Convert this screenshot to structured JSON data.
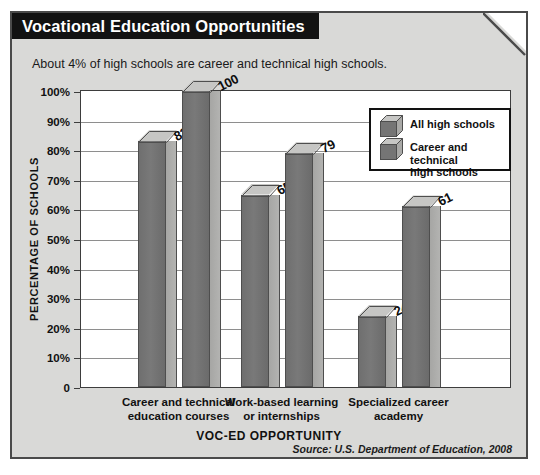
{
  "panel": {
    "title": "Vocational Education Opportunities",
    "subtitle": "About 4% of high schools are career and technical high schools.",
    "source": "Source: U.S. Department of Education, 2008",
    "background_color": "#d9d9d7",
    "title_bar_color": "#121212",
    "border_color": "#4a4a4a"
  },
  "chart_data": {
    "type": "bar",
    "title": "Vocational Education Opportunities",
    "subtitle": "About 4% of high schools are career and technical high schools.",
    "xlabel": "VOC-ED OPPORTUNITY",
    "ylabel": "PERCENTAGE OF SCHOOLS",
    "ylim": [
      0,
      100
    ],
    "ytick_labels": [
      "100%",
      "90%",
      "80%",
      "70%",
      "60%",
      "50%",
      "40%",
      "30%",
      "20%",
      "10%",
      "0"
    ],
    "ytick_values": [
      100,
      90,
      80,
      70,
      60,
      50,
      40,
      30,
      20,
      10,
      0
    ],
    "grid": true,
    "grid_axis": "y",
    "legend_position": "upper right",
    "categories": [
      "Career and technical\neducation courses",
      "Work-based learning\nor internships",
      "Specialized career\nacademy"
    ],
    "category_lines": [
      [
        "Career and technical",
        "education courses"
      ],
      [
        "Work-based learning",
        "or internships"
      ],
      [
        "Specialized career",
        "academy"
      ]
    ],
    "series": [
      {
        "name": "All high schools",
        "values": [
          83,
          65,
          24
        ],
        "color": "#757575"
      },
      {
        "name": "Career and technical high schools",
        "values": [
          100,
          79,
          61
        ],
        "color": "#757575"
      }
    ],
    "value_labels": [
      "83",
      "100",
      "65",
      "79",
      "24",
      "61"
    ],
    "source": "Source: U.S. Department of Education, 2008"
  },
  "legend": {
    "items": [
      {
        "label_line1": "All high schools",
        "label_line2": ""
      },
      {
        "label_line1": "Career and technical",
        "label_line2": "high schools"
      }
    ]
  }
}
